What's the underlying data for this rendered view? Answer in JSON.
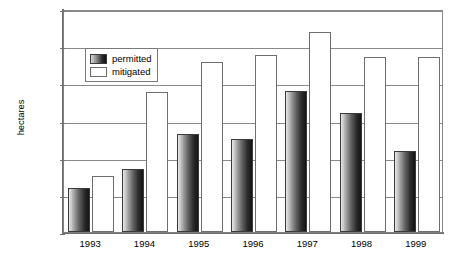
{
  "chart_data": {
    "type": "bar",
    "title": "",
    "xlabel": "",
    "ylabel": "hectares",
    "categories": [
      "1993",
      "1994",
      "1995",
      "1996",
      "1997",
      "1998",
      "1999"
    ],
    "series": [
      {
        "name": "permitted",
        "values": [
          4700,
          6800,
          10500,
          10000,
          15200,
          12800,
          8700
        ]
      },
      {
        "name": "mitigated",
        "values": [
          6000,
          15100,
          18300,
          19100,
          21500,
          18800,
          18800
        ]
      }
    ],
    "ylim": [
      0,
      24000
    ],
    "ytick_values": [
      0,
      4000,
      8000,
      12000,
      16000,
      20000,
      24000
    ],
    "ytick_labels": [
      "0",
      "4,000",
      "8,000",
      "12,000",
      "16,000",
      "20,000",
      "24,000"
    ],
    "grid": true,
    "legend_position": "upper-left-inside",
    "colors": {
      "permitted_light": "#e8e8e8",
      "permitted_dark": "#141414",
      "mitigated_fill": "#ffffff",
      "axis": "#6e6e6e",
      "gridline": "#8a8a8a",
      "text": "#000000"
    }
  },
  "caption": {
    "text": ""
  }
}
